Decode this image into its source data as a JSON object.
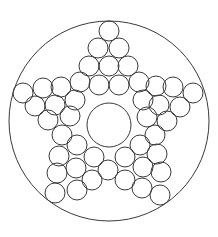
{
  "diagram": {
    "stroke_color": "#3a3a3a",
    "background": "#ffffff",
    "outer_circle": {
      "cx": 109,
      "cy": 121,
      "r": 100
    },
    "center_circle": {
      "cx": 109,
      "cy": 125,
      "r": 22
    },
    "small_circle_radius": 10,
    "small_circles": [
      [
        109,
        31
      ],
      [
        98,
        48
      ],
      [
        119,
        48
      ],
      [
        89,
        66
      ],
      [
        109,
        66
      ],
      [
        128,
        66
      ],
      [
        80,
        82
      ],
      [
        99,
        85
      ],
      [
        119,
        85
      ],
      [
        139,
        82
      ],
      [
        23,
        93
      ],
      [
        43,
        88
      ],
      [
        61,
        87
      ],
      [
        35,
        106
      ],
      [
        55,
        105
      ],
      [
        75,
        100
      ],
      [
        48,
        120
      ],
      [
        70,
        116
      ],
      [
        62,
        135
      ],
      [
        193,
        93
      ],
      [
        173,
        87
      ],
      [
        156,
        86
      ],
      [
        180,
        107
      ],
      [
        159,
        105
      ],
      [
        143,
        100
      ],
      [
        167,
        121
      ],
      [
        147,
        117
      ],
      [
        155,
        135
      ],
      [
        77,
        145
      ],
      [
        59,
        156
      ],
      [
        94,
        157
      ],
      [
        57,
        173
      ],
      [
        76,
        168
      ],
      [
        92,
        180
      ],
      [
        55,
        193
      ],
      [
        77,
        190
      ],
      [
        108,
        170
      ],
      [
        140,
        145
      ],
      [
        157,
        154
      ],
      [
        125,
        157
      ],
      [
        161,
        172
      ],
      [
        143,
        167
      ],
      [
        125,
        180
      ],
      [
        160,
        195
      ],
      [
        142,
        188
      ]
    ]
  }
}
